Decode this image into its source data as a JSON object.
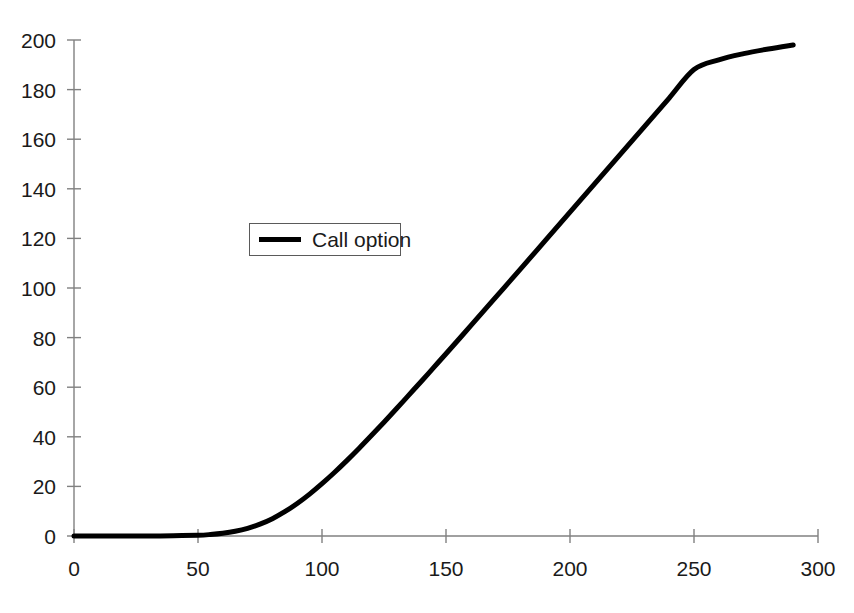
{
  "chart_data": {
    "type": "line",
    "title": "",
    "subtitle": "",
    "xlabel": "",
    "ylabel": "",
    "xlim": [
      0,
      300
    ],
    "ylim": [
      0,
      200
    ],
    "grid": false,
    "legend_position": "upper-left-inside",
    "x_ticks": [
      "0",
      "50",
      "100",
      "150",
      "200",
      "250",
      "300"
    ],
    "x_tick_values": [
      0,
      50,
      100,
      150,
      200,
      250,
      300
    ],
    "y_ticks": [
      "0",
      "20",
      "40",
      "60",
      "80",
      "100",
      "120",
      "140",
      "160",
      "180",
      "200"
    ],
    "y_tick_values": [
      0,
      20,
      40,
      60,
      80,
      100,
      120,
      140,
      160,
      180,
      200
    ],
    "series": [
      {
        "name": "Call option",
        "color": "#000000",
        "line_width": 5,
        "x": [
          0,
          10,
          20,
          30,
          40,
          50,
          55,
          60,
          65,
          70,
          75,
          80,
          85,
          90,
          95,
          100,
          105,
          110,
          115,
          120,
          125,
          130,
          135,
          140,
          145,
          150,
          160,
          170,
          180,
          190,
          200,
          210,
          220,
          230,
          240,
          250,
          260,
          270,
          280,
          290
        ],
        "values": [
          0,
          0,
          0,
          0,
          0.1,
          0.3,
          0.6,
          1.1,
          1.9,
          3.1,
          4.8,
          7.0,
          9.8,
          13.1,
          16.9,
          21.1,
          25.6,
          30.4,
          35.4,
          40.6,
          45.9,
          51.3,
          56.8,
          62.3,
          67.9,
          73.5,
          84.8,
          96.2,
          107.6,
          119.1,
          130.6,
          142.1,
          153.6,
          165.1,
          176.6,
          188.1,
          192.0,
          194.5,
          196.4,
          198.0
        ]
      }
    ],
    "legend": [
      {
        "label": "Call option",
        "color": "#000000"
      }
    ],
    "axis_color": "#808080",
    "tick_color": "#808080",
    "text_color": "#1a1a1a",
    "background": "#ffffff"
  },
  "legend": {
    "entry_label": "Call option"
  }
}
